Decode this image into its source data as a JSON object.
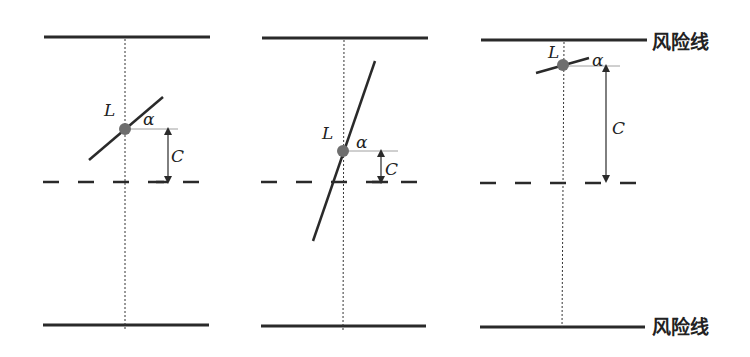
{
  "colors": {
    "stroke": "#2a2a2a",
    "pivot": "#6e6e6e",
    "background": "#ffffff"
  },
  "labels": {
    "risk_line_top": "风险线",
    "risk_line_bottom": "风险线"
  },
  "panels": [
    {
      "id": "panel-1",
      "rod_label": "L",
      "angle_label": "α",
      "distance_label": "C",
      "risk_top_y": 37,
      "risk_bottom_y": 325,
      "threshold_y": 182,
      "center_x": 125,
      "pivot": [
        125,
        129
      ],
      "rod": [
        [
          89,
          160
        ],
        [
          163,
          97
        ]
      ],
      "ref_end_x": 178,
      "arrow_x": 168
    },
    {
      "id": "panel-2",
      "rod_label": "L",
      "angle_label": "α",
      "distance_label": "C",
      "risk_top_y": 38,
      "risk_bottom_y": 326,
      "threshold_y": 182,
      "center_x": 344,
      "pivot": [
        343,
        151
      ],
      "rod": [
        [
          313,
          241
        ],
        [
          375,
          61
        ]
      ],
      "ref_end_x": 398,
      "arrow_x": 381
    },
    {
      "id": "panel-3",
      "rod_label": "L",
      "angle_label": "α",
      "distance_label": "C",
      "risk_top_y": 40,
      "risk_bottom_y": 327,
      "threshold_y": 183,
      "center_x": 563,
      "pivot": [
        563,
        65
      ],
      "rod": [
        [
          536,
          73
        ],
        [
          589,
          58
        ]
      ],
      "ref_end_x": 620,
      "arrow_x": 606
    }
  ]
}
